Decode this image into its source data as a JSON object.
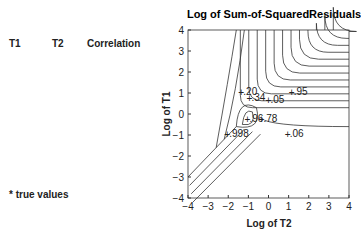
{
  "table": {
    "headers": [
      "T1",
      "T2",
      "Correlation"
    ],
    "rows": [
      [
        "10.0",
        "0.01",
        "0.20"
      ],
      [
        "10.0",
        "10.00",
        "−0.95"
      ],
      [
        "5.0",
        "0.05",
        "0.34"
      ],
      [
        "5.0",
        "0.50",
        "−0.05"
      ],
      [
        "*1.0",
        "0.10",
        "0.86"
      ],
      [
        "0.5",
        "0.50",
        "0.78"
      ],
      [
        "0.5",
        "0.05",
        "0.96"
      ],
      [
        "0.1",
        "10.00",
        "0.06"
      ],
      [
        "0.1",
        "0.01",
        "0.998"
      ]
    ],
    "footnote": "* true values"
  },
  "chart_data": {
    "type": "contour",
    "title": "Log of Sum-of-SquaredResiduals",
    "xlabel": "Log of T2",
    "ylabel": "Log of T1",
    "xlim": [
      -4,
      4
    ],
    "ylim": [
      -4,
      4
    ],
    "xticks": [
      "−4",
      "−3",
      "−2",
      "−1",
      "0",
      "1",
      "2",
      "3",
      "4"
    ],
    "yticks": [
      "4",
      "3",
      "2",
      "1",
      "0",
      "−1",
      "−2",
      "−3",
      "−4"
    ],
    "grid": false,
    "annotations": [
      {
        "label": ".20",
        "x": -1.3,
        "y": 1.0
      },
      {
        "label": ".34",
        "x": -0.9,
        "y": 0.7
      },
      {
        "label": ".05",
        "x": 0.05,
        "y": 0.6
      },
      {
        "label": ".95",
        "x": 1.2,
        "y": 1.0
      },
      {
        "label": ".96",
        "x": -1.0,
        "y": -0.3
      },
      {
        "label": ".78",
        "x": -0.3,
        "y": -0.3
      },
      {
        "label": ".998",
        "x": -2.0,
        "y": -1.0
      },
      {
        "label": ".06",
        "x": 1.0,
        "y": -1.0
      }
    ]
  }
}
